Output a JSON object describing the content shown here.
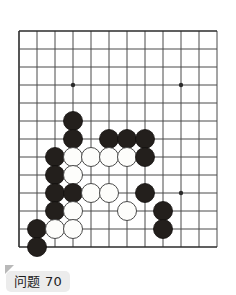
{
  "caption": {
    "label": "问题 70",
    "fold_icon": "page-fold-icon"
  },
  "board": {
    "title": "go-board",
    "cols": 12,
    "rows": 13,
    "origin_x": 19,
    "origin_y": 31,
    "spacing": 18,
    "line_color": "#4b4b4b",
    "edge_color": "#2b2b2b",
    "background": "#ffffff",
    "stone_radius": 9.5,
    "star_points": [
      {
        "col": 3,
        "row": 3
      },
      {
        "col": 9,
        "row": 3
      },
      {
        "col": 9,
        "row": 9
      }
    ],
    "star_radius": 2.2,
    "stones": [
      {
        "color": "black",
        "col": 3,
        "row": 5
      },
      {
        "color": "black",
        "col": 3,
        "row": 6
      },
      {
        "color": "black",
        "col": 5,
        "row": 6
      },
      {
        "color": "black",
        "col": 6,
        "row": 6
      },
      {
        "color": "black",
        "col": 7,
        "row": 6
      },
      {
        "color": "black",
        "col": 2,
        "row": 7
      },
      {
        "color": "white",
        "col": 3,
        "row": 7
      },
      {
        "color": "white",
        "col": 4,
        "row": 7
      },
      {
        "color": "white",
        "col": 5,
        "row": 7
      },
      {
        "color": "white",
        "col": 6,
        "row": 7
      },
      {
        "color": "black",
        "col": 7,
        "row": 7
      },
      {
        "color": "black",
        "col": 2,
        "row": 8
      },
      {
        "color": "white",
        "col": 3,
        "row": 8
      },
      {
        "color": "black",
        "col": 2,
        "row": 9
      },
      {
        "color": "black",
        "col": 3,
        "row": 9
      },
      {
        "color": "white",
        "col": 4,
        "row": 9
      },
      {
        "color": "white",
        "col": 5,
        "row": 9
      },
      {
        "color": "black",
        "col": 7,
        "row": 9
      },
      {
        "color": "black",
        "col": 2,
        "row": 10
      },
      {
        "color": "white",
        "col": 3,
        "row": 10
      },
      {
        "color": "white",
        "col": 6,
        "row": 10
      },
      {
        "color": "black",
        "col": 8,
        "row": 10
      },
      {
        "color": "black",
        "col": 1,
        "row": 11
      },
      {
        "color": "white",
        "col": 2,
        "row": 11
      },
      {
        "color": "white",
        "col": 3,
        "row": 11
      },
      {
        "color": "black",
        "col": 8,
        "row": 11
      },
      {
        "color": "black",
        "col": 1,
        "row": 12
      }
    ]
  }
}
